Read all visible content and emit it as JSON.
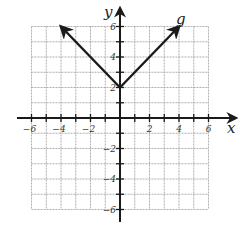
{
  "chart_data": {
    "type": "line",
    "title": "",
    "xlabel": "x",
    "ylabel": "y",
    "function_label": "g",
    "function": "g(x) = |x| + 2",
    "xlim": [
      -6,
      6
    ],
    "ylim": [
      -6,
      6
    ],
    "grid": true,
    "grid_style": "dashed",
    "x_ticks": [
      -6,
      -4,
      -2,
      2,
      4,
      6
    ],
    "y_ticks": [
      -6,
      -4,
      -2,
      2,
      4,
      6
    ],
    "series": [
      {
        "name": "g",
        "points": [
          [
            -4,
            6
          ],
          [
            0,
            2
          ],
          [
            4,
            6
          ]
        ],
        "arrows_at_ends": true
      }
    ],
    "vertex": [
      0,
      2
    ]
  },
  "colors": {
    "axis": "#1a1a1a",
    "grid": "#9a9a9a",
    "line": "#1a1a1a"
  }
}
